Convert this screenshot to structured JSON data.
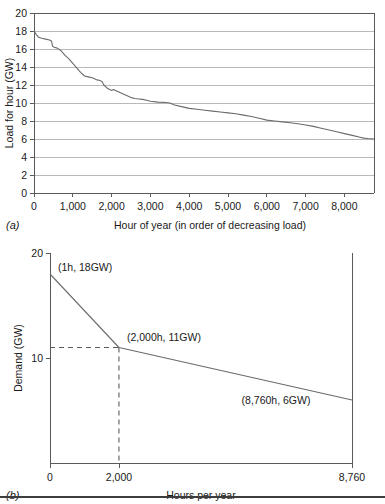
{
  "figure": {
    "panels": [
      {
        "letter": "(a)",
        "xlabel": "Hour of year (in order of decreasing load)",
        "ylabel": "Load for hour (GW)"
      },
      {
        "letter": "(b)",
        "xlabel": "Hours per year",
        "ylabel": "Demand (GW)"
      }
    ]
  },
  "chart_data": [
    {
      "type": "line",
      "id": "load-duration-curve-actual",
      "title": "",
      "xlabel": "Hour of year (in order of decreasing load)",
      "ylabel": "Load for hour (GW)",
      "xlim": [
        0,
        8760
      ],
      "ylim": [
        0,
        20
      ],
      "xticks": [
        0,
        1000,
        2000,
        3000,
        4000,
        5000,
        6000,
        7000,
        8000
      ],
      "xticklabels": [
        "0",
        "1,000",
        "2,000",
        "3,000",
        "4,000",
        "5,000",
        "6,000",
        "7,000",
        "8,000"
      ],
      "yticks": [
        0,
        2,
        4,
        6,
        8,
        10,
        12,
        14,
        16,
        18,
        20
      ],
      "yticklabels": [
        "0",
        "2",
        "4",
        "6",
        "8",
        "10",
        "12",
        "14",
        "16",
        "18",
        "20"
      ],
      "grid": "horizontal",
      "legend": "none",
      "series": [
        {
          "name": "Load for hour",
          "x": [
            0,
            60,
            120,
            200,
            300,
            400,
            450,
            480,
            520,
            600,
            700,
            800,
            900,
            1000,
            1100,
            1200,
            1300,
            1400,
            1500,
            1600,
            1700,
            1750,
            1800,
            1900,
            2000,
            2050,
            2100,
            2200,
            2300,
            2400,
            2500,
            2600,
            2700,
            2800,
            2900,
            3000,
            3200,
            3400,
            3500,
            3600,
            3800,
            4000,
            4200,
            4400,
            4600,
            4800,
            5000,
            5200,
            5400,
            5600,
            5800,
            6000,
            6200,
            6400,
            6600,
            6800,
            7000,
            7200,
            7400,
            7600,
            7800,
            8000,
            8200,
            8400,
            8500,
            8600,
            8760
          ],
          "y": [
            18.0,
            17.6,
            17.3,
            17.2,
            17.1,
            17.0,
            16.9,
            16.3,
            16.2,
            16.1,
            15.8,
            15.3,
            14.9,
            14.4,
            13.9,
            13.4,
            13.0,
            12.9,
            12.8,
            12.6,
            12.5,
            12.4,
            12.0,
            11.6,
            11.4,
            11.5,
            11.4,
            11.2,
            11.0,
            10.8,
            10.6,
            10.5,
            10.45,
            10.4,
            10.3,
            10.2,
            10.1,
            10.05,
            10.0,
            9.8,
            9.6,
            9.4,
            9.3,
            9.2,
            9.1,
            9.0,
            8.9,
            8.8,
            8.65,
            8.5,
            8.3,
            8.1,
            8.0,
            7.9,
            7.8,
            7.7,
            7.55,
            7.4,
            7.2,
            7.0,
            6.8,
            6.6,
            6.4,
            6.2,
            6.1,
            6.05,
            6.0
          ]
        }
      ]
    },
    {
      "type": "line",
      "id": "load-duration-curve-idealized",
      "title": "",
      "xlabel": "Hours per year",
      "ylabel": "Demand (GW)",
      "xlim": [
        0,
        8760
      ],
      "ylim": [
        0,
        20
      ],
      "xticks": [
        0,
        2000,
        8760
      ],
      "xticklabels": [
        "0",
        "2,000",
        "8,760"
      ],
      "yticks": [
        10,
        20
      ],
      "yticklabels": [
        "10",
        "20"
      ],
      "grid": "none",
      "legend": "none",
      "series": [
        {
          "name": "Demand",
          "x": [
            1,
            2000,
            8760
          ],
          "y": [
            18,
            11,
            6
          ]
        }
      ],
      "annotations": [
        {
          "text": "(1h, 18GW)",
          "x": 1,
          "y": 18
        },
        {
          "text": "(2,000h, 11GW)",
          "x": 2000,
          "y": 11
        },
        {
          "text": "(8,760h, 6GW)",
          "x": 8760,
          "y": 6
        }
      ],
      "guides": [
        {
          "type": "dashed-horizontal",
          "y": 11,
          "from_x": 0,
          "to_x": 2000
        },
        {
          "type": "dashed-vertical",
          "x": 2000,
          "from_y": 0,
          "to_y": 11
        }
      ]
    }
  ]
}
